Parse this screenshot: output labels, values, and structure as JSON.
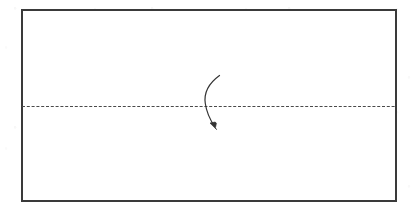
{
  "canvas": {
    "width": 412,
    "height": 211,
    "background_color": "#ffffff"
  },
  "figure": {
    "title": "",
    "caption": "",
    "kind": "paper-fold-diagram",
    "colors": {
      "outline": "#3a3a3a",
      "fold_line": "#4a4a4a",
      "arrow": "#333333",
      "background": "#ffffff"
    },
    "sheet": {
      "label": "",
      "shape": "rectangle",
      "x": 22,
      "y": 10,
      "width": 374,
      "height": 191,
      "stroke_color": "#3a3a3a",
      "stroke_width": 1.1,
      "fill": "#ffffff"
    },
    "fold_line": {
      "label": "",
      "orientation": "horizontal",
      "style": "dashed",
      "x1": 22,
      "y1": 106.5,
      "x2": 396,
      "y2": 106.5,
      "stroke_color": "#4a4a4a",
      "stroke_width": 1.1,
      "dash_length": 3,
      "gap_length": 1.8
    },
    "fold_arrow": {
      "label": "",
      "direction": "fold-down",
      "start_x": 219,
      "start_y": 76,
      "end_x": 215,
      "end_y": 128,
      "control_x": 198,
      "control_y": 103,
      "stroke_color": "#333333",
      "stroke_width": 1.2,
      "arrowhead": "solid-triangle",
      "arrowhead_size": 6
    }
  }
}
